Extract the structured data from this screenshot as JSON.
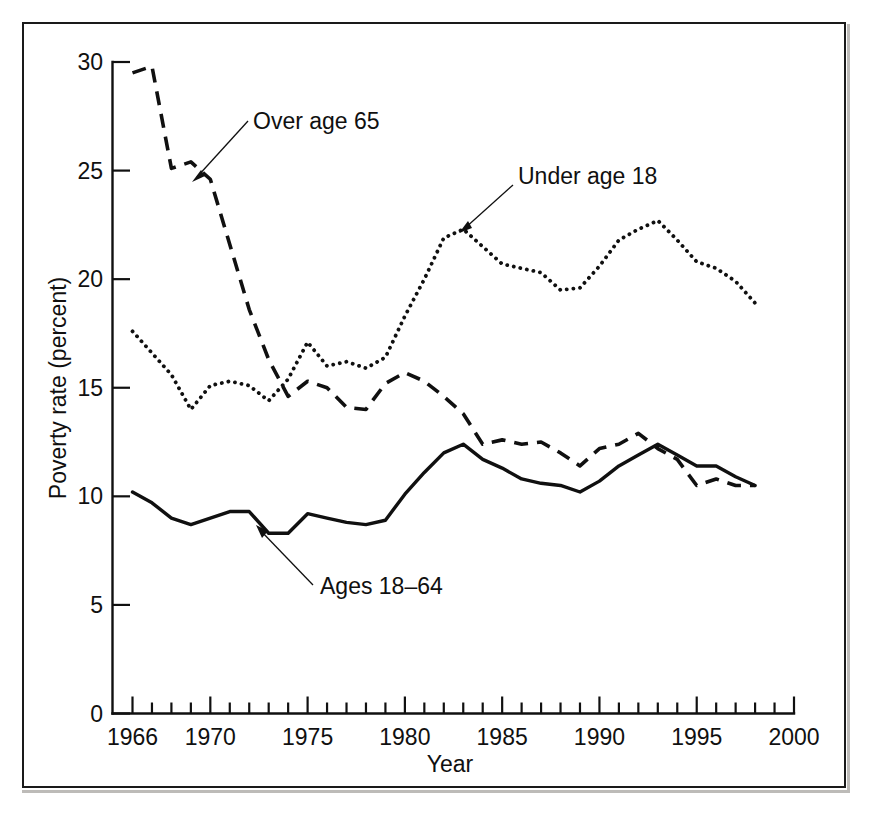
{
  "figure": {
    "background_color": "#ffffff",
    "frame_color": "#1a1a1a",
    "line_color": "#101010"
  },
  "axes": {
    "x_axis_title": "Year",
    "y_axis_title": "Poverty rate (percent)",
    "x_tick_labels": [
      "1966",
      "1970",
      "1975",
      "1980",
      "1985",
      "1990",
      "1995",
      "2000"
    ],
    "y_tick_labels": [
      "0",
      "5",
      "10",
      "15",
      "20",
      "25",
      "30"
    ]
  },
  "annotations": [
    {
      "id": "over-65",
      "text": "Over age 65"
    },
    {
      "id": "under-18",
      "text": "Under age 18"
    },
    {
      "id": "ages-18-64",
      "text": "Ages 18–64"
    }
  ],
  "chart_data": {
    "type": "line",
    "title": "",
    "subtitle": "",
    "xlabel": "Year",
    "ylabel": "Poverty rate (percent)",
    "xlim": [
      1966,
      2000
    ],
    "ylim": [
      0,
      30
    ],
    "x_ticks_major": [
      1966,
      1970,
      1975,
      1980,
      1985,
      1990,
      1995,
      2000
    ],
    "x_ticks_minor_interval": 1,
    "y_ticks": [
      0,
      5,
      10,
      15,
      20,
      25,
      30
    ],
    "grid": false,
    "legend": "inline annotations with leader lines",
    "x": [
      1966,
      1967,
      1968,
      1969,
      1970,
      1971,
      1972,
      1973,
      1974,
      1975,
      1976,
      1977,
      1978,
      1979,
      1980,
      1981,
      1982,
      1983,
      1984,
      1985,
      1986,
      1987,
      1988,
      1989,
      1990,
      1991,
      1992,
      1993,
      1994,
      1995,
      1996,
      1997,
      1998
    ],
    "series": [
      {
        "name": "Over age 65",
        "style": "dashed",
        "values": [
          29.5,
          29.8,
          25.1,
          25.4,
          24.6,
          21.6,
          18.6,
          16.3,
          14.6,
          15.3,
          15.0,
          14.1,
          14.0,
          15.2,
          15.7,
          15.3,
          14.6,
          13.8,
          12.4,
          12.6,
          12.4,
          12.5,
          12.0,
          11.4,
          12.2,
          12.4,
          12.9,
          12.2,
          11.7,
          10.5,
          10.8,
          10.5,
          10.5
        ]
      },
      {
        "name": "Under age 18",
        "style": "dotted",
        "values": [
          17.6,
          16.6,
          15.6,
          14.0,
          15.1,
          15.3,
          15.1,
          14.4,
          15.4,
          17.1,
          16.0,
          16.2,
          15.9,
          16.4,
          18.3,
          20.0,
          21.9,
          22.3,
          21.5,
          20.7,
          20.5,
          20.3,
          19.5,
          19.6,
          20.6,
          21.8,
          22.3,
          22.7,
          21.8,
          20.8,
          20.5,
          19.9,
          18.9
        ]
      },
      {
        "name": "Ages 18–64",
        "style": "solid",
        "values": [
          10.2,
          9.7,
          9.0,
          8.7,
          9.0,
          9.3,
          9.3,
          8.3,
          8.3,
          9.2,
          9.0,
          8.8,
          8.7,
          8.9,
          10.1,
          11.1,
          12.0,
          12.4,
          11.7,
          11.3,
          10.8,
          10.6,
          10.5,
          10.2,
          10.7,
          11.4,
          11.9,
          12.4,
          11.9,
          11.4,
          11.4,
          10.9,
          10.5
        ]
      }
    ]
  }
}
